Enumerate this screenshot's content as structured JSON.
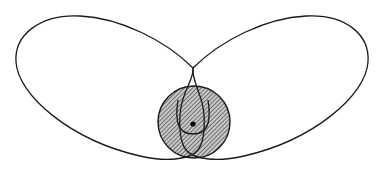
{
  "diagram": {
    "type": "orbit-figure-eight",
    "colors": {
      "background": "#ffffff",
      "stroke": "#1a1a1a",
      "hatch_fill": "#c8c8c8",
      "hatch_line": "#333333",
      "dot": "#000000"
    },
    "central_body": {
      "cx": 194,
      "cy": 122,
      "r": 36,
      "fill": "hatched"
    },
    "center_point": {
      "cx": 193,
      "cy": 124,
      "r": 2.6
    },
    "loops": [
      {
        "name": "left-loop",
        "path": "M 193 68 C 150 20, 60 5, 22 55 C -5 95, 60 160, 160 160 C 185 160, 200 150, 200 128 C 200 108, 190 80, 193 68"
      },
      {
        "name": "right-loop",
        "path": "M 193 68 C 236 20, 326 5, 364 55 C 391 95, 326 160, 226 160 C 201 160, 186 150, 186 128 C 186 108, 196 80, 193 68"
      }
    ]
  }
}
